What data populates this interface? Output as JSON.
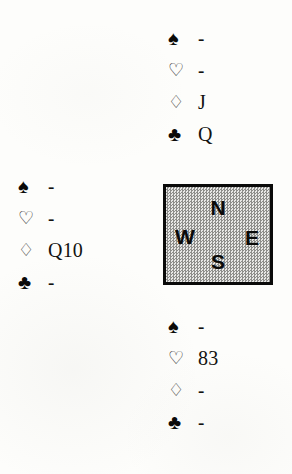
{
  "diagram": {
    "type": "bridge-hand-diagram",
    "suit_symbols": {
      "spades": "♠",
      "hearts": "♡",
      "diamonds": "♢",
      "clubs": "♣"
    },
    "compass": {
      "north": "N",
      "west": "W",
      "east": "E",
      "south": "S"
    },
    "hands": {
      "north": {
        "spades": "-",
        "hearts": "-",
        "diamonds": "J",
        "clubs": "Q"
      },
      "west": {
        "spades": "-",
        "hearts": "-",
        "diamonds": "Q10",
        "clubs": "-"
      },
      "south": {
        "spades": "-",
        "hearts": "83",
        "diamonds": "-",
        "clubs": "-"
      }
    }
  },
  "colors": {
    "ink": "#0a0a09",
    "paper": "#fdfdfb",
    "box_fill": "#c9c9c6"
  }
}
